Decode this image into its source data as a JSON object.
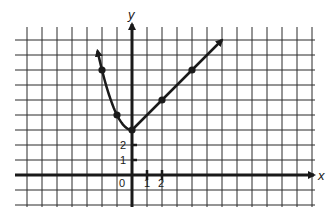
{
  "chart_data": {
    "type": "line",
    "title": "",
    "xlabel": "x",
    "ylabel": "y",
    "xlim": [
      -7,
      12
    ],
    "ylim": [
      -2,
      9
    ],
    "grid": true,
    "grid_unit": 1,
    "x_tick_labels": [
      {
        "value": 0,
        "label": "0"
      },
      {
        "value": 1,
        "label": "1"
      },
      {
        "value": 2,
        "label": "2"
      }
    ],
    "y_tick_labels": [
      {
        "value": 1,
        "label": "1"
      },
      {
        "value": 2,
        "label": "2"
      }
    ],
    "series": [
      {
        "name": "left branch (curve, y = x^2 + 3)",
        "points": [
          [
            -2,
            7
          ],
          [
            -1,
            4
          ],
          [
            0,
            3
          ]
        ],
        "arrow_end": [
          -2.3,
          8.4
        ]
      },
      {
        "name": "right branch (line, y = x + 3)",
        "points": [
          [
            0,
            3
          ],
          [
            2,
            5
          ],
          [
            4,
            7
          ]
        ],
        "arrow_end": [
          6,
          9
        ]
      }
    ],
    "legend": null
  },
  "labels": {
    "x_axis": "x",
    "y_axis": "y",
    "origin": "0",
    "x_tick_1": "1",
    "x_tick_2": "2",
    "y_tick_1": "1",
    "y_tick_2": "2"
  },
  "colors": {
    "ink": "#1a1a1a",
    "grid": "#2a2a2a",
    "background": "#ffffff"
  }
}
